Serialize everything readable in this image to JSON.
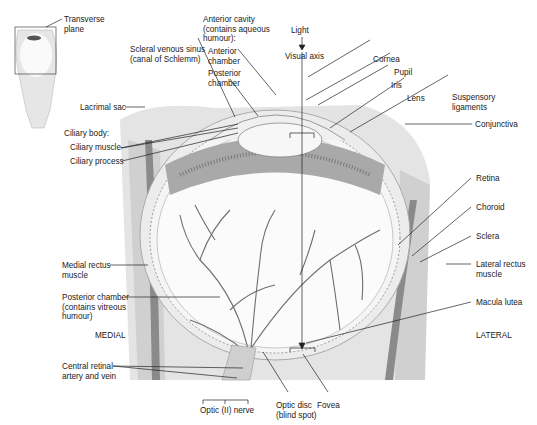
{
  "figure": {
    "inset": {
      "label": "Transverse\nplane"
    },
    "labels": {
      "anterior_cavity": "Anterior cavity\n(contains aqueous\nhumour):",
      "anterior_chamber": "Anterior\nchamber",
      "posterior_chamber_ant": "Posterior\nchamber",
      "scleral_venous_sinus": "Scleral venous sinus\n(canal of Schlemm)",
      "light": "Light",
      "visual_axis": "Visual axis",
      "cornea": "Cornea",
      "pupil": "Pupil",
      "iris": "Iris",
      "lens": "Lens",
      "suspensory_ligaments": "Suspensory\nligaments",
      "conjunctiva": "Conjunctiva",
      "lacrimal_sac": "Lacrimal sac",
      "ciliary_body": "Ciliary body:",
      "ciliary_muscle": "Ciliary muscle",
      "ciliary_process": "Ciliary process",
      "retina": "Retina",
      "choroid": "Choroid",
      "sclera": "Sclera",
      "lateral_rectus": "Lateral rectus\nmuscle",
      "medial_rectus": "Medial rectus\nmuscle",
      "posterior_chamber_vitreous": "Posterior chamber\n(contains vitreous\nhumour)",
      "medial": "MEDIAL",
      "lateral": "LATERAL",
      "macula_lutea": "Macula lutea",
      "central_retinal": "Central retinal\nartery and vein",
      "optic_nerve": "Optic (II) nerve",
      "optic_disc": "Optic disc\n(blind spot)",
      "fovea": "Fovea"
    },
    "colors": {
      "line": "#222222",
      "tissue": "#d9d9d9",
      "tissue_dark": "#8a8a8a",
      "vessel": "#6e6e6e",
      "lens": "#f2f2f2"
    }
  }
}
